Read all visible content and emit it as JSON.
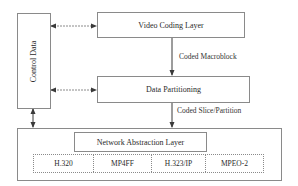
{
  "diagram": {
    "control_data": {
      "label": "Control Data"
    },
    "video_coding_layer": {
      "label": "Video Coding Layer"
    },
    "data_partitioning": {
      "label": "Data Partitioning"
    },
    "network_abstraction_layer": {
      "label": "Network Abstraction Layer"
    },
    "edges": {
      "vcl_to_dp": {
        "label": "Coded Macroblock"
      },
      "dp_to_nal": {
        "label": "Coded Slice/Partition"
      }
    },
    "transports": [
      {
        "label": "H.320"
      },
      {
        "label": "MP4FF"
      },
      {
        "label": "H.323/IP"
      },
      {
        "label": "MPEO-2"
      }
    ],
    "colors": {
      "line": "#8a8a8a",
      "arrow": "#3a3a3a",
      "text": "#2a2a2a"
    }
  }
}
